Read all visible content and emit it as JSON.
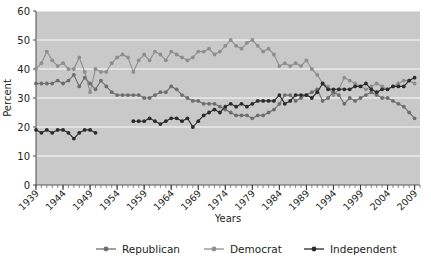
{
  "chart_data": {
    "type": "line",
    "title": "",
    "subtitle": "",
    "xlabel": "Years",
    "ylabel": "Percent",
    "xlim": [
      1939,
      2010
    ],
    "ylim": [
      0,
      60
    ],
    "ytick_step": 10,
    "yticks": [
      "0",
      "10",
      "20",
      "30",
      "40",
      "50",
      "60"
    ],
    "xticks": [
      "1939",
      "1944",
      "1949",
      "1954",
      "1959",
      "1964",
      "1969",
      "1974",
      "1979",
      "1984",
      "1989",
      "1994",
      "1999",
      "2004",
      "2009"
    ],
    "xtick_rotation_deg": 45,
    "minor_xticks": "yearly",
    "grid": "horizontal-only",
    "grid_color": "#ffffff",
    "plot_background": "#c9c9c9",
    "page_background": "#ffffff",
    "legend_position": "bottom-center",
    "legend": [
      {
        "name": "Republican",
        "color": "#6e6e6e"
      },
      {
        "name": "Democrat",
        "color": "#8e8e8e"
      },
      {
        "name": "Independent",
        "color": "#2b2b2b"
      }
    ],
    "x": [
      1939,
      1940,
      1941,
      1942,
      1943,
      1944,
      1945,
      1946,
      1947,
      1948,
      1949,
      1950,
      1951,
      1952,
      1953,
      1954,
      1955,
      1956,
      1957,
      1958,
      1959,
      1960,
      1961,
      1962,
      1963,
      1964,
      1965,
      1966,
      1967,
      1968,
      1969,
      1970,
      1971,
      1972,
      1973,
      1974,
      1975,
      1976,
      1977,
      1978,
      1979,
      1980,
      1981,
      1982,
      1983,
      1984,
      1985,
      1986,
      1987,
      1988,
      1989,
      1990,
      1991,
      1992,
      1993,
      1994,
      1995,
      1996,
      1997,
      1998,
      1999,
      2000,
      2001,
      2002,
      2003,
      2004,
      2005,
      2006,
      2007,
      2008,
      2009
    ],
    "series": [
      {
        "name": "Democrat",
        "color": "#8e8e8e",
        "values": [
          40,
          42,
          46,
          43,
          41,
          42,
          40,
          40,
          44,
          39,
          32,
          40,
          39,
          39,
          42,
          44,
          45,
          44,
          39,
          43,
          45,
          43,
          46,
          45,
          43,
          46,
          45,
          44,
          43,
          44,
          46,
          46,
          47,
          45,
          46,
          48,
          50,
          48,
          47,
          49,
          50,
          48,
          46,
          47,
          45,
          41,
          42,
          41,
          42,
          41,
          43,
          40,
          38,
          35,
          34,
          31,
          33,
          37,
          36,
          35,
          34,
          33,
          34,
          35,
          34,
          33,
          34,
          35,
          36,
          36,
          35
        ]
      },
      {
        "name": "Republican",
        "color": "#6e6e6e",
        "values": [
          35,
          35,
          35,
          35,
          36,
          35,
          36,
          38,
          34,
          37,
          35,
          33,
          36,
          34,
          32,
          31,
          31,
          31,
          31,
          31,
          30,
          30,
          31,
          32,
          32,
          34,
          33,
          31,
          30,
          29,
          29,
          28,
          28,
          28,
          27,
          26,
          25,
          24,
          24,
          24,
          23,
          24,
          24,
          25,
          26,
          28,
          31,
          31,
          29,
          30,
          31,
          32,
          33,
          29,
          30,
          32,
          31,
          28,
          30,
          29,
          30,
          31,
          32,
          31,
          30,
          30,
          29,
          28,
          27,
          25,
          23
        ]
      },
      {
        "name": "Independent",
        "color": "#2b2b2b",
        "values": [
          19,
          18,
          19,
          18,
          19,
          19,
          18,
          16,
          18,
          19,
          19,
          18,
          null,
          null,
          null,
          null,
          null,
          null,
          22,
          22,
          22,
          23,
          22,
          21,
          22,
          23,
          23,
          22,
          23,
          20,
          22,
          24,
          25,
          26,
          25,
          27,
          28,
          27,
          28,
          27,
          28,
          29,
          29,
          29,
          29,
          31,
          28,
          29,
          31,
          31,
          31,
          30,
          32,
          35,
          33,
          33,
          33,
          33,
          33,
          34,
          34,
          35,
          33,
          32,
          33,
          33,
          34,
          34,
          34,
          36,
          37
        ]
      }
    ]
  }
}
